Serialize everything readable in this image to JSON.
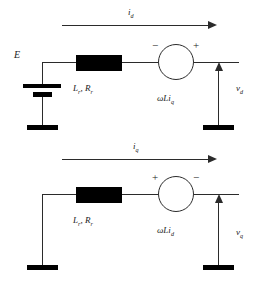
{
  "figure": {
    "stroke_color": "#2b2b2b",
    "fill_color": "#000000",
    "background": "#ffffff"
  },
  "d_axis_circuit": {
    "name": "d-axis equivalent circuit",
    "current_label": "i",
    "current_sub": "d",
    "emf_label": "E",
    "impedance_label_l": "L",
    "impedance_sub_l": "r",
    "impedance_sep": ", ",
    "impedance_label_r": "R",
    "impedance_sub_r": "r",
    "source_label": "ωLi",
    "source_sub": "q",
    "source_left_sign": "−",
    "source_right_sign": "+",
    "voltage_label": "v",
    "voltage_sub": "d"
  },
  "q_axis_circuit": {
    "name": "q-axis equivalent circuit",
    "current_label": "i",
    "current_sub": "q",
    "impedance_label_l": "L",
    "impedance_sub_l": "r",
    "impedance_sep": ", ",
    "impedance_label_r": "R",
    "impedance_sub_r": "r",
    "source_label": "ωLi",
    "source_sub": "d",
    "source_left_sign": "+",
    "source_right_sign": "−",
    "voltage_label": "v",
    "voltage_sub": "q"
  }
}
